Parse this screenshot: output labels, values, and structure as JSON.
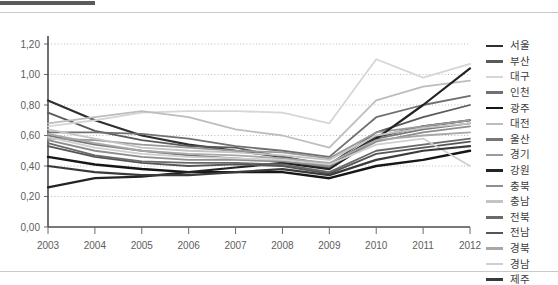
{
  "page": {
    "background_color": "#ffffff",
    "rule_color": "#c9c9c9",
    "top_bar_color": "#5a5a5a"
  },
  "chart_data": {
    "type": "line",
    "title": "",
    "subtitle": "",
    "xlabel": "",
    "ylabel": "",
    "x": [
      2003,
      2004,
      2005,
      2006,
      2007,
      2008,
      2009,
      2010,
      2011,
      2012
    ],
    "xtick_labels": [
      "2003",
      "2004",
      "2005",
      "2006",
      "2007",
      "2008",
      "2009",
      "2010",
      "2011",
      "2012"
    ],
    "ytick_labels": [
      "0,00",
      "0,20",
      "0,40",
      "0,60",
      "0,80",
      "1,00",
      "1,20"
    ],
    "ytick_values": [
      0.0,
      0.2,
      0.4,
      0.6,
      0.8,
      1.0,
      1.2
    ],
    "ylim": [
      0.0,
      1.2
    ],
    "grid": "horizontal-dotted",
    "legend_position": "right",
    "decimal_separator": ",",
    "series": [
      {
        "name": "서울",
        "color": "#2f2f2f",
        "width": 2.2,
        "values": [
          0.83,
          0.7,
          0.6,
          0.54,
          0.5,
          0.46,
          0.4,
          0.59,
          0.66,
          0.7
        ]
      },
      {
        "name": "부산",
        "color": "#5a5a5a",
        "width": 1.8,
        "values": [
          0.75,
          0.63,
          0.57,
          0.53,
          0.52,
          0.46,
          0.41,
          0.62,
          0.72,
          0.8
        ]
      },
      {
        "name": "대구",
        "color": "#d6d6d6",
        "width": 1.8,
        "values": [
          0.66,
          0.7,
          0.75,
          0.76,
          0.76,
          0.75,
          0.68,
          1.1,
          0.98,
          1.07
        ]
      },
      {
        "name": "인천",
        "color": "#707070",
        "width": 1.8,
        "values": [
          0.62,
          0.62,
          0.61,
          0.58,
          0.53,
          0.5,
          0.46,
          0.72,
          0.8,
          0.86
        ]
      },
      {
        "name": "광주",
        "color": "#161616",
        "width": 2.4,
        "values": [
          0.46,
          0.41,
          0.38,
          0.36,
          0.36,
          0.36,
          0.32,
          0.4,
          0.44,
          0.5
        ]
      },
      {
        "name": "대전",
        "color": "#bdbdbd",
        "width": 1.8,
        "values": [
          0.68,
          0.72,
          0.76,
          0.72,
          0.64,
          0.6,
          0.52,
          0.83,
          0.92,
          0.96
        ]
      },
      {
        "name": "울산",
        "color": "#777777",
        "width": 1.8,
        "values": [
          0.6,
          0.54,
          0.5,
          0.47,
          0.45,
          0.43,
          0.39,
          0.58,
          0.64,
          0.68
        ]
      },
      {
        "name": "경기",
        "color": "#9a9a9a",
        "width": 1.8,
        "values": [
          0.58,
          0.57,
          0.54,
          0.52,
          0.5,
          0.49,
          0.45,
          0.62,
          0.66,
          0.7
        ]
      },
      {
        "name": "강원",
        "color": "#232323",
        "width": 2.2,
        "values": [
          0.26,
          0.32,
          0.33,
          0.36,
          0.39,
          0.42,
          0.38,
          0.58,
          0.8,
          1.04
        ]
      },
      {
        "name": "충북",
        "color": "#8e8e8e",
        "width": 1.8,
        "values": [
          0.57,
          0.5,
          0.46,
          0.44,
          0.44,
          0.43,
          0.4,
          0.56,
          0.62,
          0.66
        ]
      },
      {
        "name": "충남",
        "color": "#c4c4c4",
        "width": 1.8,
        "values": [
          0.64,
          0.58,
          0.52,
          0.5,
          0.49,
          0.47,
          0.44,
          0.6,
          0.65,
          0.68
        ]
      },
      {
        "name": "전북",
        "color": "#6a6a6a",
        "width": 1.8,
        "values": [
          0.55,
          0.47,
          0.43,
          0.42,
          0.42,
          0.41,
          0.36,
          0.5,
          0.54,
          0.58
        ]
      },
      {
        "name": "전남",
        "color": "#555555",
        "width": 1.8,
        "values": [
          0.53,
          0.46,
          0.42,
          0.4,
          0.41,
          0.4,
          0.35,
          0.48,
          0.52,
          0.56
        ]
      },
      {
        "name": "경북",
        "color": "#a8a8a8",
        "width": 1.8,
        "values": [
          0.61,
          0.55,
          0.5,
          0.48,
          0.47,
          0.45,
          0.42,
          0.57,
          0.6,
          0.62
        ]
      },
      {
        "name": "경남",
        "color": "#cfcfcf",
        "width": 1.8,
        "values": [
          0.59,
          0.52,
          0.48,
          0.46,
          0.45,
          0.44,
          0.41,
          0.54,
          0.58,
          0.4
        ]
      },
      {
        "name": "제주",
        "color": "#3a3a3a",
        "width": 2.2,
        "values": [
          0.4,
          0.36,
          0.34,
          0.34,
          0.36,
          0.38,
          0.34,
          0.44,
          0.5,
          0.53
        ]
      }
    ]
  }
}
